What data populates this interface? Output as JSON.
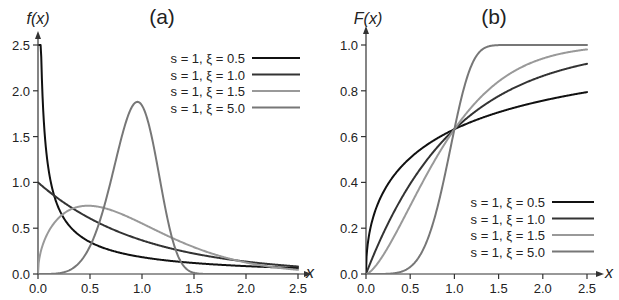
{
  "chart_data": [
    {
      "type": "line",
      "title": "(a)",
      "xlabel": "x",
      "ylabel": "f(x)",
      "distribution": "Weibull probability density, scale s, shape ξ",
      "xlim": [
        0,
        2.5
      ],
      "ylim": [
        0,
        2.5
      ],
      "xticks": [
        "0.0",
        "0.5",
        "1.0",
        "1.5",
        "2.0",
        "2.5"
      ],
      "yticks": [
        "0.0",
        "0.5",
        "1.0",
        "1.5",
        "2.0",
        "2.5"
      ],
      "xtick_values": [
        0,
        0.5,
        1.0,
        1.5,
        2.0,
        2.5
      ],
      "ytick_values": [
        0,
        0.5,
        1.0,
        1.5,
        2.0,
        2.5
      ],
      "grid": false,
      "legend_position": "top-right",
      "series": [
        {
          "name": "s = 1, ξ = 0.5",
          "s": 1,
          "xi": 0.5,
          "color": "#111111",
          "x": [
            0.01,
            0.05,
            0.1,
            0.25,
            0.5,
            1.0,
            1.5,
            2.0,
            2.5
          ],
          "y": [
            4.52,
            1.78,
            1.15,
            0.61,
            0.35,
            0.18,
            0.12,
            0.09,
            0.07
          ]
        },
        {
          "name": "s = 1, ξ = 1.0",
          "s": 1,
          "xi": 1.0,
          "color": "#333333",
          "x": [
            0,
            0.25,
            0.5,
            1.0,
            1.5,
            2.0,
            2.5
          ],
          "y": [
            1.0,
            0.78,
            0.61,
            0.37,
            0.22,
            0.14,
            0.08
          ]
        },
        {
          "name": "s = 1, ξ = 1.5",
          "s": 1,
          "xi": 1.5,
          "color": "#999999",
          "x": [
            0,
            0.25,
            0.5,
            0.75,
            1.0,
            1.5,
            2.0,
            2.5
          ],
          "y": [
            0,
            0.66,
            0.74,
            0.68,
            0.55,
            0.29,
            0.13,
            0.05
          ]
        },
        {
          "name": "s = 1, ξ = 5.0",
          "s": 1,
          "xi": 5.0,
          "color": "#777777",
          "x": [
            0,
            0.25,
            0.5,
            0.75,
            0.95,
            1.0,
            1.25,
            1.5,
            2.0
          ],
          "y": [
            0,
            0.02,
            0.3,
            1.26,
            1.89,
            1.84,
            0.57,
            0.02,
            0
          ]
        }
      ]
    },
    {
      "type": "line",
      "title": "(b)",
      "xlabel": "x",
      "ylabel": "F(x)",
      "distribution": "Weibull cumulative distribution, scale s, shape ξ",
      "xlim": [
        0,
        2.5
      ],
      "ylim": [
        0,
        1.0
      ],
      "xticks": [
        "0.0",
        "0.5",
        "1.0",
        "1.5",
        "2.0",
        "2.5"
      ],
      "yticks": [
        "0.0",
        "0.2",
        "0.4",
        "0.6",
        "0.8",
        "1.0"
      ],
      "xtick_values": [
        0,
        0.5,
        1.0,
        1.5,
        2.0,
        2.5
      ],
      "ytick_values": [
        0,
        0.2,
        0.4,
        0.6,
        0.8,
        1.0
      ],
      "grid": false,
      "legend_position": "bottom-right",
      "annotations": [
        "All curves cross at x = 1.0, F ≈ 0.63"
      ],
      "series": [
        {
          "name": "s = 1, ξ = 0.5",
          "s": 1,
          "xi": 0.5,
          "color": "#111111",
          "x": [
            0,
            0.25,
            0.5,
            1.0,
            1.5,
            2.0,
            2.5
          ],
          "y": [
            0,
            0.39,
            0.51,
            0.63,
            0.71,
            0.76,
            0.79
          ]
        },
        {
          "name": "s = 1, ξ = 1.0",
          "s": 1,
          "xi": 1.0,
          "color": "#333333",
          "x": [
            0,
            0.25,
            0.5,
            1.0,
            1.5,
            2.0,
            2.5
          ],
          "y": [
            0,
            0.22,
            0.39,
            0.63,
            0.78,
            0.86,
            0.92
          ]
        },
        {
          "name": "s = 1, ξ = 1.5",
          "s": 1,
          "xi": 1.5,
          "color": "#999999",
          "x": [
            0,
            0.25,
            0.5,
            1.0,
            1.5,
            2.0,
            2.5
          ],
          "y": [
            0,
            0.12,
            0.3,
            0.63,
            0.84,
            0.94,
            0.98
          ]
        },
        {
          "name": "s = 1, ξ = 5.0",
          "s": 1,
          "xi": 5.0,
          "color": "#777777",
          "x": [
            0,
            0.5,
            0.75,
            1.0,
            1.25,
            1.5,
            2.5
          ],
          "y": [
            0,
            0.03,
            0.21,
            0.63,
            0.95,
            1.0,
            1.0
          ]
        }
      ]
    }
  ]
}
